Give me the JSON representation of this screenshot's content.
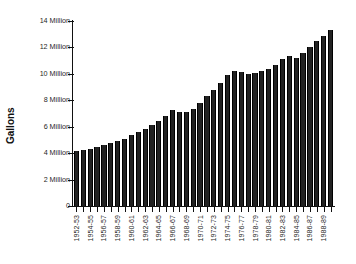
{
  "chart_data": {
    "type": "bar",
    "title": "",
    "subtitle": "",
    "xlabel": "",
    "ylabel": "Gallons",
    "ylim": [
      0,
      14000000
    ],
    "ytick_labels": [
      "14 Million",
      "12 Million",
      "10 Million",
      "8 Million",
      "6 Million",
      "4 Million",
      "2 Million",
      "0"
    ],
    "ytick_values": [
      14000000,
      12000000,
      10000000,
      8000000,
      6000000,
      4000000,
      2000000,
      0
    ],
    "grid": false,
    "legend": false,
    "legend_position": "none",
    "bar_color": "#222222",
    "axis_color": "#111111",
    "background_color": "#ffffff",
    "categories": [
      "1952-53",
      "1953-54",
      "1954-55",
      "1955-56",
      "1956-57",
      "1957-58",
      "1958-59",
      "1959-60",
      "1960-61",
      "1961-62",
      "1962-63",
      "1963-64",
      "1964-65",
      "1965-66",
      "1966-67",
      "1967-68",
      "1968-69",
      "1969-70",
      "1970-71",
      "1971-72",
      "1972-73",
      "1973-74",
      "1974-75",
      "1975-76",
      "1976-77",
      "1977-78",
      "1978-79",
      "1979-80",
      "1980-81",
      "1981-82",
      "1982-83",
      "1983-84",
      "1984-85",
      "1985-86",
      "1986-87",
      "1987-88",
      "1988-89",
      "1989-90"
    ],
    "xtick_labels": [
      "1952-53",
      "1954-55",
      "1956-57",
      "1958-59",
      "1960-61",
      "1962-63",
      "1964-65",
      "1966-67",
      "1968-69",
      "1970-71",
      "1972-73",
      "1974-75",
      "1976-77",
      "1978-79",
      "1980-81",
      "1982-83",
      "1984-85",
      "1986-87",
      "1988-89"
    ],
    "values": [
      4200000,
      4250000,
      4350000,
      4450000,
      4600000,
      4750000,
      4900000,
      5100000,
      5350000,
      5600000,
      5850000,
      6100000,
      6400000,
      6800000,
      7250000,
      7150000,
      7100000,
      7350000,
      7800000,
      8300000,
      8800000,
      9300000,
      9900000,
      10250000,
      10150000,
      10000000,
      10050000,
      10200000,
      10400000,
      10700000,
      11100000,
      11350000,
      11200000,
      11550000,
      12000000,
      12450000,
      12900000,
      13300000
    ]
  }
}
